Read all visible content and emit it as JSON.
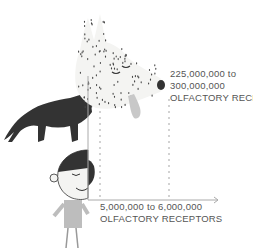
{
  "figure": {
    "dog_label": {
      "line1": "225,000,000 to",
      "line2": "300,000,000",
      "line3": "OLFACTORY RECEPTORS"
    },
    "human_label": {
      "line1": "5,000,000 to 6,000,000",
      "line2": "OLFACTORY RECEPTORS"
    },
    "colors": {
      "axis": "#aaaaaa",
      "dots": "#999999",
      "dark_dog": "#333333",
      "dog_head": "#f4f4f2",
      "tongue": "#c8c8c8",
      "shirt": "#bdbdbd",
      "text": "#555555"
    }
  }
}
